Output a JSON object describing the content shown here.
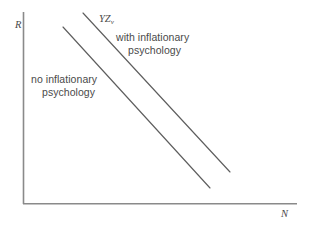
{
  "figure": {
    "background_color": "#ffffff",
    "line_color": "#5e5e5e",
    "axis_color": "#8a8a8a",
    "text_color": "#4a4a4a"
  },
  "axes": {
    "y_label": "R",
    "x_label": "N",
    "origin": [
      23,
      204
    ],
    "y_top": 12,
    "x_right": 297
  },
  "curve_label": {
    "base": "YZ",
    "subscript": "v"
  },
  "annotations": {
    "with_inflation_line1": "with inflationary",
    "with_inflation_line2": "psychology",
    "no_inflation_line1": "no inflationary",
    "no_inflation_line2": "psychology"
  },
  "chart_data": {
    "type": "line",
    "title": "",
    "xlabel": "N",
    "ylabel": "R",
    "xlim": [
      0,
      100
    ],
    "ylim": [
      0,
      100
    ],
    "grid": false,
    "legend": "inline-annotations",
    "series": [
      {
        "name": "YZ with inflationary psychology",
        "comment": "upper-right parallel schedule",
        "x": [
          21.9,
          75.5
        ],
        "y": [
          99.5,
          16.7
        ],
        "pixel_start": [
          83,
          13
        ],
        "pixel_end": [
          230,
          172
        ],
        "slope": -1.08
      },
      {
        "name": "YZ no inflationary psychology",
        "comment": "lower-left parallel schedule",
        "x": [
          14.6,
          68.2
        ],
        "y": [
          92.2,
          8.3
        ],
        "pixel_start": [
          63,
          27
        ],
        "pixel_end": [
          210,
          188
        ],
        "slope": -1.1
      }
    ]
  }
}
